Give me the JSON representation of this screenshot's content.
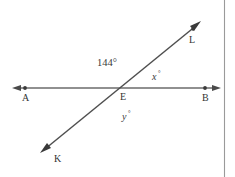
{
  "figure": {
    "background_color": "#ffffff",
    "line_color": "#5a5a5a",
    "text_color": "#3a3a3a",
    "border_color": "#9a9a9a"
  },
  "points": {
    "a": {
      "label": "A",
      "x": 25,
      "y": 88,
      "label_x": 25,
      "label_y": 101
    },
    "b": {
      "label": "B",
      "x": 205,
      "y": 88,
      "label_x": 205,
      "label_y": 101
    },
    "e": {
      "label": "E",
      "x": 116,
      "y": 88,
      "label_x": 123,
      "label_y": 100
    },
    "k": {
      "label": "K",
      "x": 47,
      "y": 147,
      "label_x": 57,
      "label_y": 161
    },
    "l": {
      "label": "L",
      "x": 193,
      "y": 29,
      "label_x": 191,
      "label_y": 42
    }
  },
  "lines": [
    {
      "name": "line-AB",
      "from_label": "A",
      "to_label": "B",
      "x1": 14,
      "y1": 88,
      "x2": 219,
      "y2": 88,
      "arrows": "both"
    },
    {
      "name": "line-KL",
      "from_label": "K",
      "to_label": "L",
      "x1": 42,
      "y1": 151,
      "x2": 199,
      "y2": 23,
      "arrows": "both"
    }
  ],
  "angles": [
    {
      "name": "angle-144",
      "label": "144°",
      "value": 144,
      "unit": "degrees",
      "position": "upper-left of E",
      "x": 97,
      "y": 66
    },
    {
      "name": "angle-x",
      "label": "x",
      "degree_mark": "°",
      "position": "upper-right of E",
      "x": 152,
      "y": 80
    },
    {
      "name": "angle-y",
      "label": "y",
      "degree_mark": "°",
      "position": "below E",
      "x": 122,
      "y": 120
    }
  ]
}
